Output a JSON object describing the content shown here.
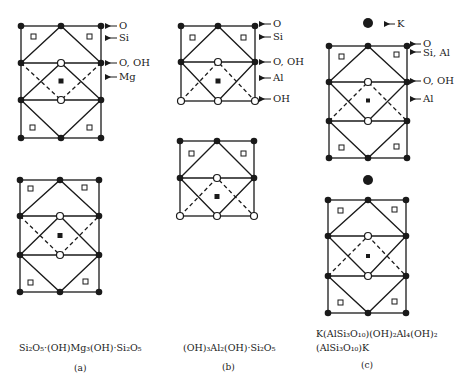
{
  "figure": {
    "panels": [
      {
        "id": "a",
        "caption": "(a)",
        "formula": "Si₂O₅·(OH)Mg₃(OH)·Si₂O₅",
        "labels": [
          "O",
          "Si",
          "O, OH",
          "Mg"
        ],
        "sheets": 2
      },
      {
        "id": "b",
        "caption": "(b)",
        "formula": "(OH)₃Al₂(OH)·Si₂O₅",
        "labels": [
          "O",
          "Si",
          "O, OH",
          "Al",
          "OH"
        ],
        "sheets": 2
      },
      {
        "id": "c",
        "caption": "(c)",
        "formula_line1": "K(AlSi₃O₁₀)(OH)₂Al₄(OH)₂",
        "formula_line2": "(AlSi₃O₁₀)K",
        "labels": [
          "K",
          "O",
          "Si, Al",
          "O, OH",
          "Al"
        ],
        "sheets": 2
      }
    ],
    "legend_symbols": {
      "filled_circle": "O (oxygen)",
      "open_circle": "OH (hydroxyl)",
      "open_square": "Si / Al tetrahedral cation",
      "filled_square": "octahedral cation (Mg / Al)",
      "large_filled_circle": "K (potassium)"
    },
    "colors": {
      "ink": "#1a1a1a",
      "background": "#ffffff"
    }
  },
  "labels": {
    "a_O": "O",
    "a_Si": "Si",
    "a_OOH": "O, OH",
    "a_Mg": "Mg",
    "b_O": "O",
    "b_Si": "Si",
    "b_OOH": "O, OH",
    "b_Al": "Al",
    "b_OH": "OH",
    "c_K": "K",
    "c_O": "O",
    "c_SiAl": "Si, Al",
    "c_OOH": "O, OH",
    "c_Al": "Al"
  },
  "captions": {
    "a": "(a)",
    "b": "(b)",
    "c": "(c)"
  }
}
